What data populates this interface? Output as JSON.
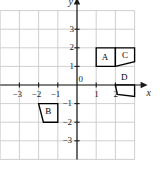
{
  "figure": {
    "kind": "coordinate-plane-diagram",
    "background_color": "#ffffff",
    "grid_color": "#c9c9c9",
    "axis_color": "#1a1a1a",
    "shape_stroke_color": "#000000",
    "shape_fill_color": "#ffffff",
    "axis_labels": {
      "x": "x",
      "y": "y"
    },
    "origin_label": "0",
    "x_ticks": [
      {
        "value": -3,
        "label": "−3"
      },
      {
        "value": -2,
        "label": "−2"
      },
      {
        "value": -1,
        "label": "−1"
      },
      {
        "value": 1,
        "label": "1"
      },
      {
        "value": 2,
        "label": "2"
      }
    ],
    "y_ticks": [
      {
        "value": 3,
        "label": "3"
      },
      {
        "value": 2,
        "label": "2"
      },
      {
        "value": 1,
        "label": "1"
      },
      {
        "value": -1,
        "label": "−1"
      },
      {
        "value": -2,
        "label": "−2"
      },
      {
        "value": -3,
        "label": "−3"
      }
    ],
    "x_range": [
      -4,
      3
    ],
    "y_range": [
      -4,
      4
    ],
    "grid_step": 1,
    "shapes": [
      {
        "label": "A",
        "label_point": [
          1.45,
          1.5
        ],
        "vertices": [
          [
            1,
            1
          ],
          [
            2,
            1
          ],
          [
            2,
            2
          ],
          [
            1,
            2
          ]
        ]
      },
      {
        "label": "C",
        "label_point": [
          2.5,
          1.58
        ],
        "vertices": [
          [
            2,
            1
          ],
          [
            3,
            1.25
          ],
          [
            3,
            2
          ],
          [
            2,
            2
          ]
        ]
      },
      {
        "label": "B",
        "label_point": [
          -1.5,
          -1.42
        ],
        "vertices": [
          [
            -2,
            -1
          ],
          [
            -1,
            -1
          ],
          [
            -1,
            -2
          ],
          [
            -1.75,
            -2
          ]
        ]
      },
      {
        "label": "D",
        "label_point": [
          2.45,
          0.42
        ],
        "vertices": [
          [
            2,
            0
          ],
          [
            3,
            0
          ],
          [
            3,
            -0.62
          ],
          [
            2.1,
            -0.5
          ]
        ]
      }
    ]
  }
}
